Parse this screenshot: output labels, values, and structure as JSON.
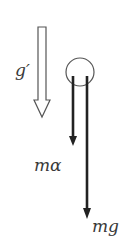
{
  "diagram": {
    "labels": {
      "g_prime": "g′",
      "ma": "mα",
      "mg": "mg"
    },
    "colors": {
      "stroke": "#222222",
      "hollow_arrow": "#555555",
      "circle": "#555555",
      "text": "#3a3a3a"
    },
    "elements": [
      {
        "type": "hollow-arrow",
        "meaning": "effective gravity g′",
        "direction": "down"
      },
      {
        "type": "circle",
        "meaning": "body / mass"
      },
      {
        "type": "force-arrow",
        "meaning": "ma",
        "direction": "down",
        "length": "short"
      },
      {
        "type": "force-arrow",
        "meaning": "mg",
        "direction": "down",
        "length": "long"
      }
    ]
  }
}
